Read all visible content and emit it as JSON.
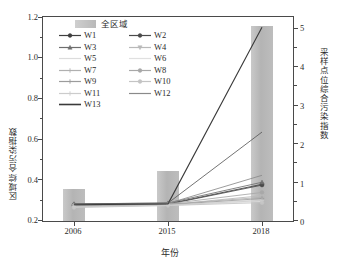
{
  "chart_data": {
    "type": "bar",
    "title": "",
    "categories": [
      "2006",
      "2015",
      "2018"
    ],
    "xlabel": "年份",
    "ylabel": "区域综合污染指数",
    "ylabel_right": "采样点位综合污染指数",
    "ylim": [
      0.2,
      1.2
    ],
    "ylim_right": [
      0,
      5
    ],
    "yticks": [
      "0.2",
      "0.4",
      "0.6",
      "0.8",
      "1.0",
      "1.2"
    ],
    "yticks_right": [
      "0",
      "1",
      "2",
      "3",
      "4",
      "5"
    ],
    "grid": false,
    "legend_position": "upper-left-inside",
    "bar_series": {
      "name": "全区域",
      "axis": "left",
      "color": "#bdbdbd",
      "values": [
        0.355,
        0.445,
        1.158
      ]
    },
    "series": [
      {
        "name": "W1",
        "axis": "right",
        "color": "#3f3f3f",
        "marker": "circle",
        "values": [
          0.4,
          0.42,
          0.9
        ]
      },
      {
        "name": "W2",
        "axis": "right",
        "color": "#4a4a4a",
        "marker": "circle",
        "values": [
          0.38,
          0.41,
          0.88
        ]
      },
      {
        "name": "W3",
        "axis": "right",
        "color": "#6e6e6e",
        "marker": "triangle",
        "values": [
          0.42,
          0.44,
          0.95
        ]
      },
      {
        "name": "W4",
        "axis": "right",
        "color": "#b9b9b9",
        "marker": "triangle-down",
        "values": [
          0.36,
          0.4,
          0.62
        ]
      },
      {
        "name": "W5",
        "axis": "right",
        "color": "#dcdcdc",
        "marker": "none",
        "values": [
          0.35,
          0.39,
          0.52
        ]
      },
      {
        "name": "W6",
        "axis": "right",
        "color": "#e0e0e0",
        "marker": "none",
        "values": [
          0.34,
          0.38,
          0.48
        ]
      },
      {
        "name": "W7",
        "axis": "right",
        "color": "#b0b0b0",
        "marker": "plus",
        "values": [
          0.37,
          0.41,
          0.58
        ]
      },
      {
        "name": "W8",
        "axis": "right",
        "color": "#a8a8a8",
        "marker": "circle",
        "values": [
          0.39,
          0.42,
          0.7
        ]
      },
      {
        "name": "W9",
        "axis": "right",
        "color": "#9c9c9c",
        "marker": "plus",
        "values": [
          0.36,
          0.4,
          0.55
        ]
      },
      {
        "name": "W10",
        "axis": "right",
        "color": "#c4c4c4",
        "marker": "circle",
        "values": [
          0.33,
          0.38,
          0.45
        ]
      },
      {
        "name": "W11",
        "axis": "right",
        "color": "#cccccc",
        "marker": "plus",
        "values": [
          0.35,
          0.39,
          0.5
        ]
      },
      {
        "name": "W12",
        "axis": "right",
        "color": "#8a8a8a",
        "marker": "none",
        "values": [
          0.41,
          0.43,
          1.12
        ]
      },
      {
        "name": "W13",
        "axis": "right",
        "color": "#3a3a3a",
        "marker": "none",
        "values": [
          0.4,
          0.42,
          4.75
        ]
      }
    ],
    "extra_series_note": "one mid-dark line rises to about 2.2 at 2018",
    "mid_line": {
      "name": "W3-group-high",
      "color": "#5a5a5a",
      "values": [
        0.42,
        0.44,
        2.18
      ]
    }
  }
}
